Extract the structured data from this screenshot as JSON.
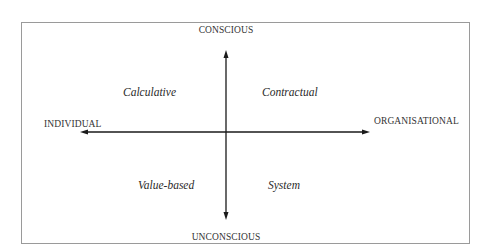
{
  "diagram": {
    "type": "quadrant-matrix",
    "axes": {
      "vertical": {
        "top_label": "CONSCIOUS",
        "bottom_label": "UNCONSCIOUS"
      },
      "horizontal": {
        "left_label": "INDIVIDUAL",
        "right_label": "ORGANISATIONAL"
      }
    },
    "quadrants": {
      "top_left": "Calculative",
      "top_right": "Contractual",
      "bottom_left": "Value-based",
      "bottom_right": "System"
    },
    "colors": {
      "frame": "#9a9a9a",
      "axis": "#1a1a1a",
      "text": "#2a2a2a",
      "background": "#ffffff"
    }
  }
}
